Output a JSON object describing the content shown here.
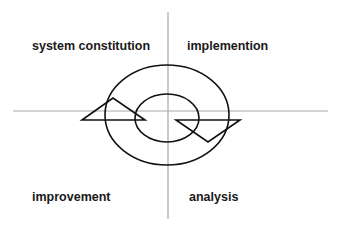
{
  "diagram": {
    "type": "quadrant-cycle",
    "quadrants": {
      "top_left": {
        "label": "system constitution"
      },
      "top_right": {
        "label": "implemention"
      },
      "bottom_left": {
        "label": "improvement"
      },
      "bottom_right": {
        "label": "analysis"
      }
    },
    "center_graphic": "two-ring spiral cycle with arrowheads",
    "colors": {
      "axis": "#a8a8a8",
      "stroke": "#111111",
      "text": "#1a1a1a",
      "background": "#ffffff"
    }
  }
}
